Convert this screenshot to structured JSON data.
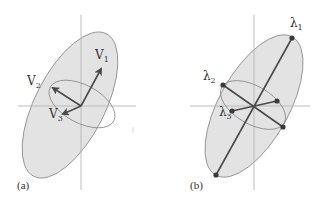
{
  "figure": {
    "panels": [
      {
        "id": "a",
        "caption": "(a)",
        "vectors": [
          {
            "name": "V1",
            "label": "V",
            "sub": "1"
          },
          {
            "name": "V2",
            "label": "V",
            "sub": "2"
          },
          {
            "name": "V3",
            "label": "V",
            "sub": "3"
          }
        ]
      },
      {
        "id": "b",
        "caption": "(b)",
        "axes": [
          {
            "name": "lambda1",
            "label": "λ",
            "sub": "1"
          },
          {
            "name": "lambda2",
            "label": "λ",
            "sub": "2"
          },
          {
            "name": "lambda3",
            "label": "λ",
            "sub": "3"
          }
        ]
      }
    ],
    "colors": {
      "ellipse_fill": "#e3e3e3",
      "ellipse_stroke": "#8a8a8a",
      "axis": "#b5b5b5",
      "arrow": "#4a4a4a",
      "text": "#333333"
    }
  }
}
